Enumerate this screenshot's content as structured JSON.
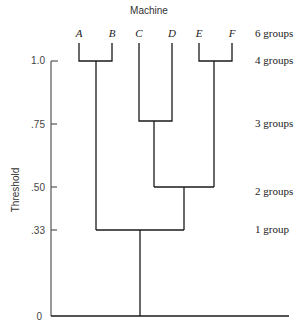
{
  "title": "Machine",
  "y_axis_label": "Threshold",
  "leaves": [
    {
      "label": "A",
      "x": 79
    },
    {
      "label": "B",
      "x": 112
    },
    {
      "label": "C",
      "x": 139
    },
    {
      "label": "D",
      "x": 172
    },
    {
      "label": "E",
      "x": 199
    },
    {
      "label": "F",
      "x": 232
    }
  ],
  "ticks": [
    {
      "label": "1.0",
      "value": 1.0
    },
    {
      "label": ".75",
      "value": 0.75
    },
    {
      "label": ".50",
      "value": 0.5
    },
    {
      "label": ".33",
      "value": 0.33
    },
    {
      "label": "0",
      "value": 0
    }
  ],
  "group_labels": [
    {
      "label": "6 groups",
      "y": 34
    },
    {
      "label": "4 groups",
      "y": 61
    },
    {
      "label": "3 groups",
      "y": 124
    },
    {
      "label": "2 groups",
      "y": 192
    },
    {
      "label": "1 group",
      "y": 230
    }
  ],
  "merges": [
    {
      "members": [
        "A",
        "B"
      ],
      "threshold": 1.0
    },
    {
      "members": [
        "E",
        "F"
      ],
      "threshold": 1.0
    },
    {
      "members": [
        "C",
        "D"
      ],
      "threshold": 0.75
    },
    {
      "members": [
        "CD",
        "EF"
      ],
      "threshold": 0.5
    },
    {
      "members": [
        "AB",
        "CDEF"
      ],
      "threshold": 0.33
    }
  ]
}
